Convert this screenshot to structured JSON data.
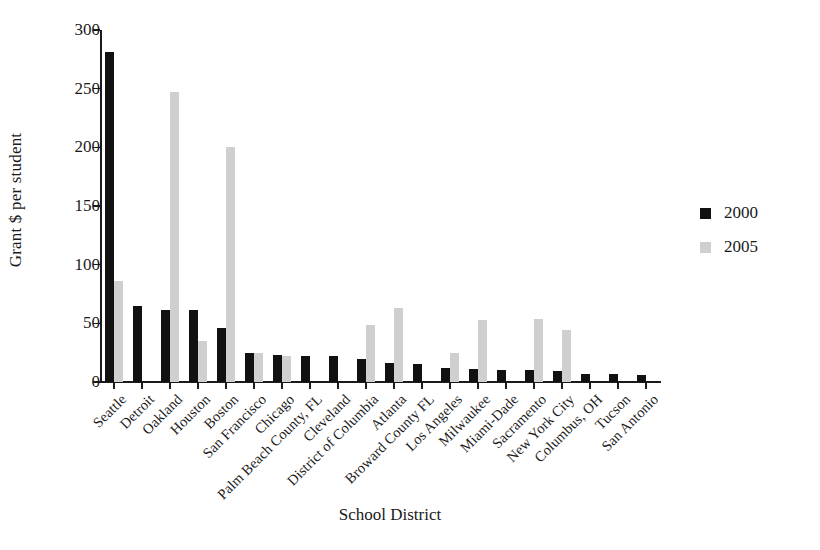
{
  "chart_data": {
    "type": "bar",
    "title": "",
    "xlabel": "School District",
    "ylabel": "Grant $ per student",
    "ylim": [
      0,
      300
    ],
    "yticks": [
      0,
      50,
      100,
      150,
      200,
      250,
      300
    ],
    "grid": false,
    "legend_position": "right",
    "categories": [
      "Seattle",
      "Detroit",
      "Oakland",
      "Houston",
      "Boston",
      "San Francisco",
      "Chicago",
      "Palm Beach County, FL",
      "Cleveland",
      "District of Columbia",
      "Atlanta",
      "Broward County FL",
      "Los Angeles",
      "Milwaukee",
      "Miami-Dade",
      "Sacramento",
      "New York City",
      "Columbus, OH",
      "Tucson",
      "San Antonio"
    ],
    "series": [
      {
        "name": "2000",
        "color": "#111111",
        "values": [
          281,
          65,
          61,
          61,
          46,
          25,
          23,
          22,
          22,
          20,
          16,
          15,
          12,
          11,
          10,
          10,
          9,
          7,
          7,
          6
        ]
      },
      {
        "name": "2005",
        "color": "#cfcfcf",
        "values": [
          86,
          0,
          247,
          35,
          200,
          25,
          22,
          0,
          0,
          49,
          63,
          0,
          25,
          53,
          0,
          54,
          44,
          0,
          0,
          0
        ]
      }
    ]
  },
  "legend": {
    "items": [
      {
        "label": "2000",
        "color": "#111111"
      },
      {
        "label": "2005",
        "color": "#cfcfcf"
      }
    ]
  },
  "axes": {
    "y_title": "Grant $ per student",
    "x_title": "School District",
    "y_tick_labels": [
      "0",
      "50",
      "100",
      "150",
      "200",
      "250",
      "300"
    ]
  }
}
